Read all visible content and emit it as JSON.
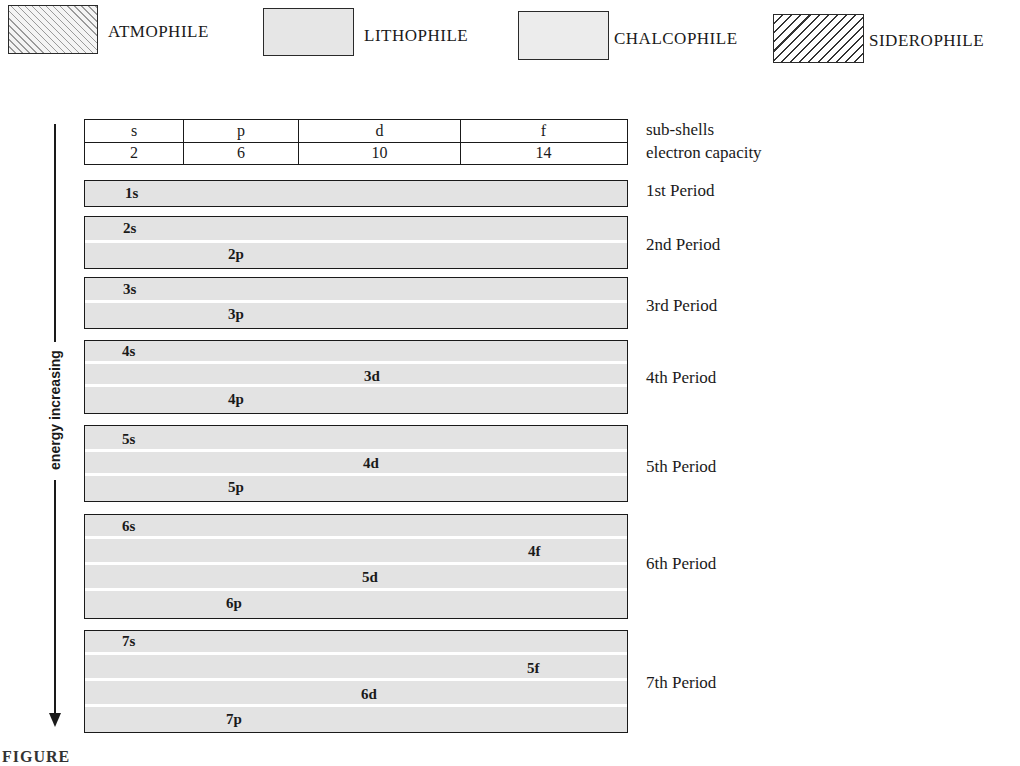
{
  "legend": [
    {
      "label": "ATMOPHILE",
      "pattern": "hatch-light-backslash"
    },
    {
      "label": "LITHOPHILE",
      "pattern": "solid-grey"
    },
    {
      "label": "CHALCOPHILE",
      "pattern": "solid-light-grey"
    },
    {
      "label": "SIDEROPHILE",
      "pattern": "hatch-dark-slash"
    }
  ],
  "header": {
    "subshells": [
      "s",
      "p",
      "d",
      "f"
    ],
    "capacities": [
      "2",
      "6",
      "10",
      "14"
    ],
    "row_labels": {
      "subshells": "sub-shells",
      "capacity": "electron capacity"
    }
  },
  "axis": {
    "label": "energy increasing",
    "direction": "down"
  },
  "periods": [
    {
      "label": "1st Period",
      "orbitals": [
        "1s"
      ]
    },
    {
      "label": "2nd Period",
      "orbitals": [
        "2s",
        "2p"
      ]
    },
    {
      "label": "3rd Period",
      "orbitals": [
        "3s",
        "3p"
      ]
    },
    {
      "label": "4th Period",
      "orbitals": [
        "4s",
        "3d",
        "4p"
      ]
    },
    {
      "label": "5th Period",
      "orbitals": [
        "5s",
        "4d",
        "5p"
      ]
    },
    {
      "label": "6th Period",
      "orbitals": [
        "6s",
        "4f",
        "5d",
        "6p"
      ]
    },
    {
      "label": "7th Period",
      "orbitals": [
        "7s",
        "5f",
        "6d",
        "7p"
      ]
    }
  ],
  "caption": "FIGURE"
}
